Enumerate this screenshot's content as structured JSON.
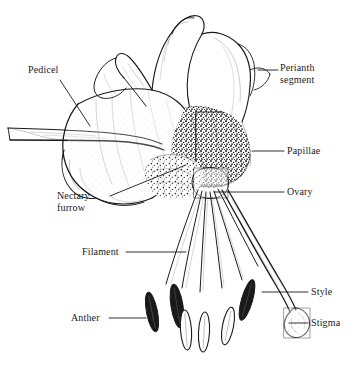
{
  "figure": {
    "style": "black-and-white-line-drawing-with-stippling",
    "background_color": "#ffffff",
    "ink_color": "#1a1a1a"
  },
  "labels": {
    "pedicel": "Pedicel",
    "perianth_segment": "Perianth\nsegment",
    "papillae": "Papillae",
    "ovary": "Ovary",
    "nectary_furrow": "Nectary\nfurrow",
    "filament": "Filament",
    "anther": "Anther",
    "style": "Style",
    "stigma": "Stigma"
  },
  "parts": [
    {
      "name": "pedicel",
      "label": "Pedicel",
      "side": "left"
    },
    {
      "name": "perianth-segment",
      "label": "Perianth segment",
      "side": "right"
    },
    {
      "name": "papillae",
      "label": "Papillae",
      "side": "right"
    },
    {
      "name": "ovary",
      "label": "Ovary",
      "side": "right"
    },
    {
      "name": "nectary-furrow",
      "label": "Nectary furrow",
      "side": "left"
    },
    {
      "name": "filament",
      "label": "Filament",
      "side": "left"
    },
    {
      "name": "anther",
      "label": "Anther",
      "side": "left"
    },
    {
      "name": "style",
      "label": "Style",
      "side": "right"
    },
    {
      "name": "stigma",
      "label": "Stigma",
      "side": "right"
    }
  ],
  "anther_count": 6,
  "tepal_count": 6
}
